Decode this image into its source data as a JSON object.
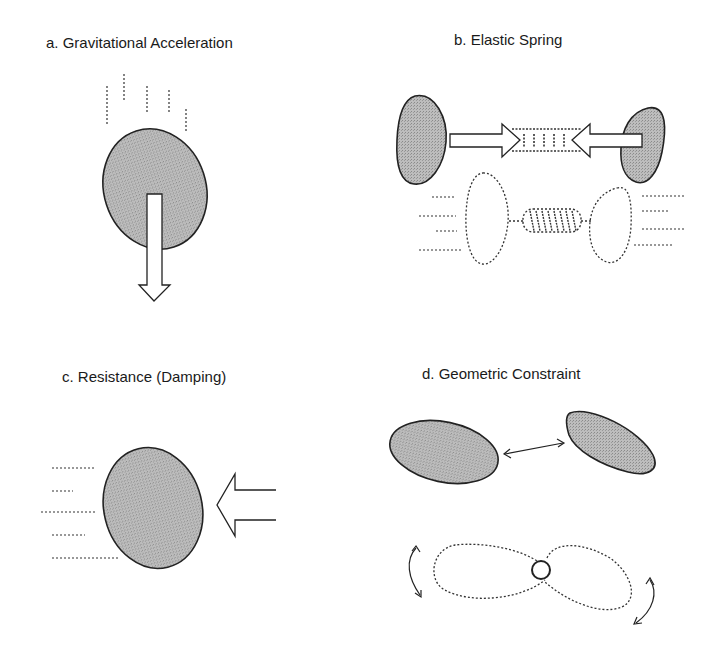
{
  "panels": [
    {
      "id": "a",
      "title": "a. Gravitational Acceleration"
    },
    {
      "id": "b",
      "title": "b. Elastic Spring"
    },
    {
      "id": "c",
      "title": "c. Resistance (Damping)"
    },
    {
      "id": "d",
      "title": "d. Geometric Constraint"
    }
  ],
  "colors": {
    "body_fill": "#b4b4b4",
    "outline": "#222222",
    "background": "#ffffff"
  }
}
